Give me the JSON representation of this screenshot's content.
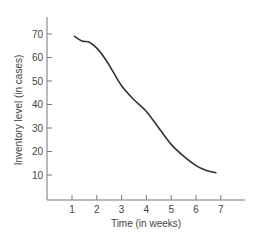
{
  "chart_data": {
    "type": "line",
    "title": "",
    "xlabel": "Time (in weeks)",
    "ylabel": "Inventory level (in cases)",
    "xlim": [
      0,
      7.5
    ],
    "ylim": [
      0,
      75
    ],
    "x_ticks": [
      1,
      2,
      3,
      4,
      5,
      6,
      7
    ],
    "y_ticks": [
      10,
      20,
      30,
      40,
      50,
      60,
      70
    ],
    "x_tick_labels": [
      "1",
      "2",
      "3",
      "4",
      "5",
      "6",
      "7"
    ],
    "y_tick_labels": [
      "10",
      "20",
      "30",
      "40",
      "50",
      "60",
      "70"
    ],
    "grid": false,
    "legend": null,
    "series": [
      {
        "name": "Inventory level",
        "color": "#333333",
        "x": [
          1.1,
          1.4,
          1.7,
          2.0,
          2.3,
          2.6,
          3.0,
          3.5,
          4.0,
          4.5,
          5.0,
          5.5,
          6.0,
          6.4,
          6.8
        ],
        "values": [
          69,
          67,
          66.5,
          64,
          60,
          55,
          48,
          42,
          37,
          30,
          23,
          18,
          14,
          12,
          11
        ]
      }
    ]
  }
}
